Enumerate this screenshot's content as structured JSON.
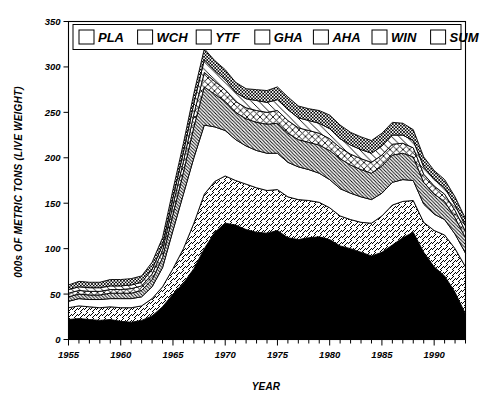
{
  "chart_data": {
    "type": "area",
    "title": "",
    "xlabel": "YEAR",
    "ylabel": "000s OF METRIC TONS (LIVE WEIGHT)",
    "stacked": true,
    "grid": false,
    "legend_position": "top-inside",
    "xlim": [
      1955,
      1993
    ],
    "ylim": [
      0,
      350
    ],
    "ytick_labels": [
      "0",
      "50",
      "100",
      "150",
      "200",
      "250",
      "300",
      "350"
    ],
    "ytick_values": [
      0,
      50,
      100,
      150,
      200,
      250,
      300,
      350
    ],
    "xtick_labels": [
      "1955",
      "1960",
      "1965",
      "1970",
      "1975",
      "1980",
      "1985",
      "1990"
    ],
    "xtick_values": [
      1955,
      1960,
      1965,
      1970,
      1975,
      1980,
      1985,
      1990
    ],
    "x": [
      1955,
      1956,
      1957,
      1958,
      1959,
      1960,
      1961,
      1962,
      1963,
      1964,
      1965,
      1966,
      1967,
      1968,
      1969,
      1970,
      1971,
      1972,
      1973,
      1974,
      1975,
      1976,
      1977,
      1978,
      1979,
      1980,
      1981,
      1982,
      1983,
      1984,
      1985,
      1986,
      1987,
      1988,
      1989,
      1990,
      1991,
      1992,
      1993
    ],
    "series": [
      {
        "name": "PLA",
        "pattern": "solid-black",
        "values": [
          22,
          23,
          22,
          21,
          22,
          20,
          19,
          21,
          26,
          36,
          50,
          62,
          78,
          100,
          118,
          128,
          126,
          121,
          118,
          117,
          120,
          112,
          110,
          112,
          113,
          110,
          103,
          100,
          96,
          92,
          96,
          104,
          112,
          118,
          96,
          80,
          70,
          52,
          28
        ]
      },
      {
        "name": "WCH",
        "pattern": "forward-diagonal",
        "values": [
          13,
          14,
          14,
          14,
          14,
          15,
          16,
          16,
          19,
          22,
          28,
          38,
          50,
          60,
          56,
          52,
          49,
          50,
          49,
          47,
          45,
          45,
          44,
          41,
          38,
          35,
          33,
          32,
          33,
          36,
          40,
          44,
          40,
          35,
          33,
          40,
          45,
          48,
          52
        ]
      },
      {
        "name": "YTF",
        "pattern": "white",
        "values": [
          7,
          8,
          8,
          9,
          9,
          10,
          10,
          10,
          13,
          21,
          42,
          60,
          72,
          76,
          60,
          50,
          45,
          42,
          41,
          41,
          40,
          38,
          36,
          34,
          32,
          31,
          30,
          29,
          28,
          26,
          25,
          25,
          24,
          22,
          20,
          18,
          17,
          16,
          15
        ]
      },
      {
        "name": "GHA",
        "pattern": "dense-backslash",
        "values": [
          5,
          5,
          5,
          5,
          6,
          6,
          6,
          7,
          8,
          11,
          18,
          24,
          34,
          42,
          36,
          32,
          30,
          30,
          31,
          32,
          33,
          32,
          30,
          30,
          31,
          32,
          33,
          31,
          30,
          29,
          30,
          30,
          29,
          26,
          24,
          22,
          20,
          18,
          17
        ]
      },
      {
        "name": "AHA",
        "pattern": "cross-hatch",
        "values": [
          4,
          4,
          4,
          4,
          4,
          4,
          5,
          5,
          6,
          8,
          10,
          12,
          14,
          16,
          14,
          13,
          12,
          12,
          13,
          13,
          14,
          14,
          13,
          13,
          13,
          13,
          12,
          12,
          12,
          12,
          12,
          12,
          11,
          10,
          9,
          9,
          8,
          8,
          7
        ]
      },
      {
        "name": "WIN",
        "pattern": "sparse-backslash",
        "values": [
          4,
          4,
          4,
          4,
          4,
          4,
          4,
          4,
          5,
          6,
          8,
          10,
          12,
          14,
          12,
          11,
          10,
          10,
          11,
          11,
          12,
          12,
          11,
          11,
          11,
          11,
          10,
          10,
          10,
          10,
          10,
          10,
          9,
          8,
          8,
          7,
          7,
          6,
          6
        ]
      },
      {
        "name": "SUM",
        "pattern": "checker",
        "values": [
          5,
          6,
          6,
          6,
          7,
          7,
          7,
          7,
          8,
          8,
          9,
          10,
          11,
          12,
          11,
          11,
          11,
          11,
          12,
          13,
          14,
          14,
          13,
          13,
          14,
          15,
          15,
          14,
          14,
          14,
          14,
          14,
          13,
          12,
          11,
          10,
          9,
          9,
          8
        ]
      }
    ],
    "totals": [
      60,
      64,
      63,
      63,
      66,
      66,
      67,
      70,
      85,
      112,
      165,
      216,
      271,
      320,
      307,
      297,
      283,
      276,
      275,
      274,
      278,
      267,
      257,
      254,
      252,
      247,
      236,
      228,
      223,
      219,
      227,
      239,
      238,
      231,
      201,
      186,
      176,
      157,
      133
    ],
    "annotations": []
  },
  "legend": {
    "items": [
      {
        "label": "PLA",
        "swatch": "solid-black-swatch"
      },
      {
        "label": "WCH",
        "swatch": "forward-diagonal-swatch"
      },
      {
        "label": "YTF",
        "swatch": "white-swatch"
      },
      {
        "label": "GHA",
        "swatch": "dense-backslash-swatch"
      },
      {
        "label": "AHA",
        "swatch": "cross-hatch-swatch"
      },
      {
        "label": "WIN",
        "swatch": "sparse-backslash-swatch"
      },
      {
        "label": "SUM",
        "swatch": "checker-swatch"
      }
    ]
  },
  "colors": {
    "ink": "#000000",
    "paper": "#ffffff"
  }
}
